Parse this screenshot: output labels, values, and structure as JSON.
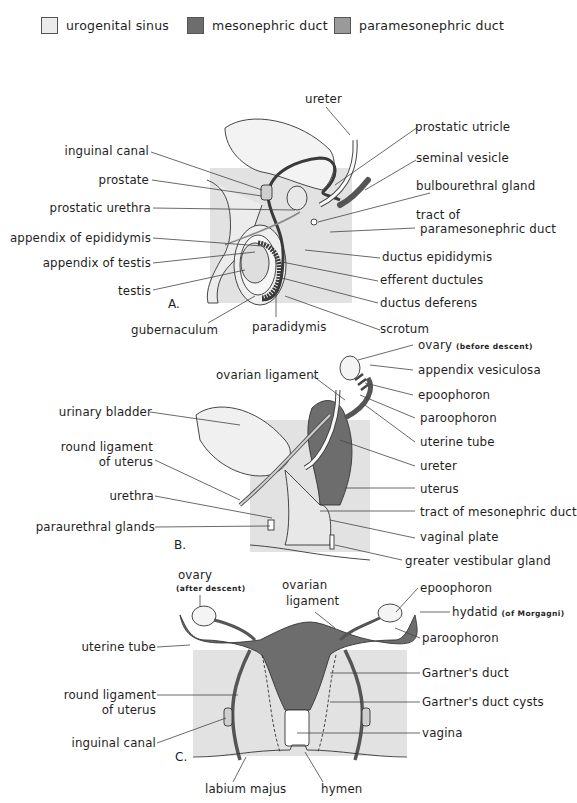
{
  "legend": {
    "items": [
      {
        "label": "urogenital sinus",
        "color": "#ececec"
      },
      {
        "label": "mesonephric duct",
        "color": "#6d6d6d"
      },
      {
        "label": "paramesonephric duct",
        "color": "#9a9a9a"
      }
    ]
  },
  "panel_a": {
    "letter": "A.",
    "labels_left": {
      "inguinal_canal": "inguinal canal",
      "prostate": "prostate",
      "prostatic_urethra": "prostatic urethra",
      "appendix_of_epididymis": "appendix of epididymis",
      "appendix_of_testis": "appendix of testis",
      "testis": "testis",
      "gubernaculum": "gubernaculum"
    },
    "labels_right": {
      "ureter": "ureter",
      "prostatic_utricle": "prostatic utricle",
      "seminal_vesicle": "seminal vesicle",
      "bulbourethral_gland": "bulbourethral gland",
      "tract_of_1": "tract of",
      "tract_of_2": "paramesonephric duct",
      "ductus_epididymis": "ductus epididymis",
      "efferent_ductules": "efferent ductules",
      "ductus_deferens": "ductus deferens",
      "scrotum": "scrotum"
    },
    "labels_bottom": {
      "paradidymis": "paradidymis"
    }
  },
  "panel_b": {
    "letter": "B.",
    "labels_left": {
      "ovarian_ligament": "ovarian ligament",
      "urinary_bladder": "urinary bladder",
      "round_ligament_1": "round ligament",
      "round_ligament_2": "of uterus",
      "urethra": "urethra",
      "paraurethral_glands": "paraurethral glands"
    },
    "labels_right": {
      "ovary": "ovary",
      "ovary_note": "(before descent)",
      "appendix_vesiculosa": "appendix vesiculosa",
      "epoophoron": "epoophoron",
      "paroophoron": "paroophoron",
      "uterine_tube": "uterine tube",
      "ureter": "ureter",
      "uterus": "uterus",
      "tract_of_mesonephric_duct": "tract of mesonephric duct",
      "vaginal_plate": "vaginal plate",
      "greater_vestibular_gland": "greater vestibular gland"
    }
  },
  "panel_c": {
    "letter": "C.",
    "labels_left": {
      "ovary": "ovary",
      "ovary_note": "(after descent)",
      "ovarian_ligament_1": "ovarian",
      "ovarian_ligament_2": "ligament",
      "uterine_tube": "uterine tube",
      "round_ligament_1": "round ligament",
      "round_ligament_2": "of uterus",
      "inguinal_canal": "inguinal canal",
      "labium_majus": "labium majus",
      "hymen": "hymen"
    },
    "labels_right": {
      "epoophoron": "epoophoron",
      "hydatid": "hydatid",
      "hydatid_note": "(of Morgagni)",
      "paroophoron": "paroophoron",
      "gartners_duct": "Gartner's duct",
      "gartners_duct_cysts": "Gartner's duct cysts",
      "vagina": "vagina"
    }
  }
}
